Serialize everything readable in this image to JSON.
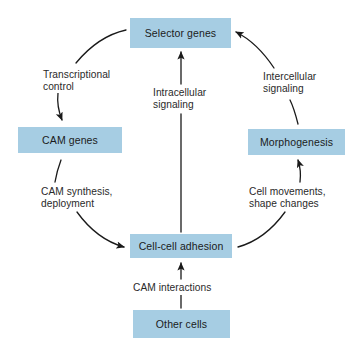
{
  "diagram": {
    "background_color": "#ffffff",
    "node_fill_color": "#a6cde3",
    "text_color": "#1b1b1b",
    "arrow_color": "#1a1a1a",
    "nodes": [
      {
        "id": "selector-genes",
        "label": "Selector genes"
      },
      {
        "id": "cam-genes",
        "label": "CAM genes"
      },
      {
        "id": "morphogenesis",
        "label": "Morphogenesis"
      },
      {
        "id": "cell-adhesion",
        "label": "Cell-cell adhesion"
      },
      {
        "id": "other-cells",
        "label": "Other cells"
      }
    ],
    "edges": [
      {
        "id": "transcriptional-control",
        "from": "selector-genes",
        "to": "cam-genes",
        "label_line1": "Transcriptional",
        "label_line2": "control"
      },
      {
        "id": "cam-synthesis",
        "from": "cam-genes",
        "to": "cell-adhesion",
        "label_line1": "CAM synthesis,",
        "label_line2": "deployment"
      },
      {
        "id": "cell-movements",
        "from": "cell-adhesion",
        "to": "morphogenesis",
        "label_line1": "Cell movements,",
        "label_line2": "shape changes"
      },
      {
        "id": "intercellular-signaling",
        "from": "morphogenesis",
        "to": "selector-genes",
        "label_line1": "Intercellular",
        "label_line2": "signaling"
      },
      {
        "id": "intracellular-signaling",
        "from": "cell-adhesion",
        "to": "selector-genes",
        "label_line1": "Intracellular",
        "label_line2": "signaling"
      },
      {
        "id": "cam-interactions",
        "from": "other-cells",
        "to": "cell-adhesion",
        "label_line1": "CAM interactions",
        "label_line2": ""
      }
    ]
  }
}
